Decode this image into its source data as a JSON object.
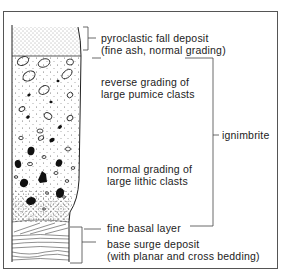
{
  "diagram": {
    "type": "stratigraphic-column",
    "layers": [
      {
        "id": "fall",
        "lines": [
          "pyroclastic fall deposit",
          "(fine ash, normal grading)"
        ]
      },
      {
        "id": "reverse",
        "lines": [
          "reverse grading of",
          "large pumice clasts"
        ]
      },
      {
        "id": "normal",
        "lines": [
          "normal grading of",
          "large lithic clasts"
        ]
      },
      {
        "id": "basal",
        "lines": [
          "fine basal layer"
        ]
      },
      {
        "id": "surge",
        "lines": [
          "base surge deposit",
          "(with planar and cross bedding)"
        ]
      }
    ],
    "group_label": "ignimbrite",
    "legend": {
      "open-clast-icon": "pumice clast",
      "filled-clast-icon": "lithic clast",
      "stipple-pattern": "fine ash",
      "wavy-lines-pattern": "planar and cross bedding"
    },
    "colors": {
      "ink": "#1a1a1a",
      "frame": "#555555",
      "paper": "#ffffff"
    }
  }
}
